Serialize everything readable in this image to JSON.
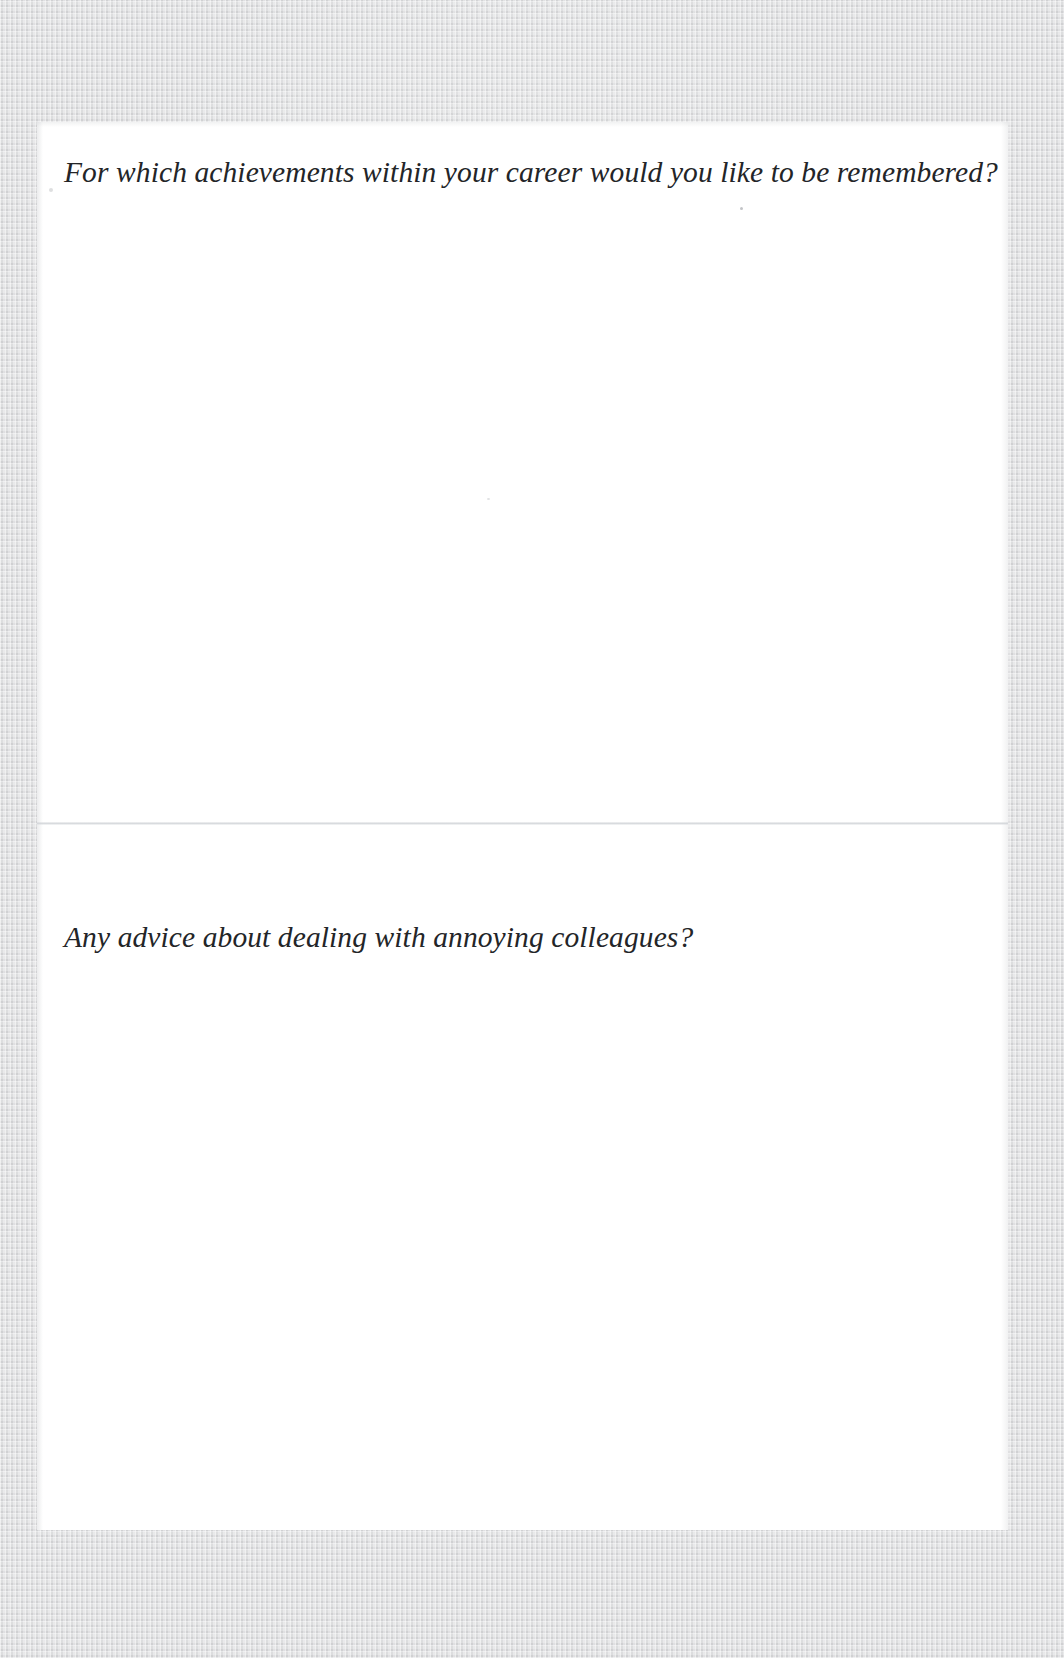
{
  "document": {
    "type": "scanned-page",
    "background_color": "#d4d5d6",
    "page_color": "#ffffff",
    "ink_color": "#232528",
    "divider_color": "#cdd0d4"
  },
  "questions": [
    {
      "id": "q1",
      "prompt": "For which achievements within your career would you like to be remembered?",
      "answer": "",
      "answer_placeholder": ""
    },
    {
      "id": "q2",
      "prompt": "Any advice about dealing with annoying colleagues?",
      "answer": "",
      "answer_placeholder": ""
    }
  ]
}
